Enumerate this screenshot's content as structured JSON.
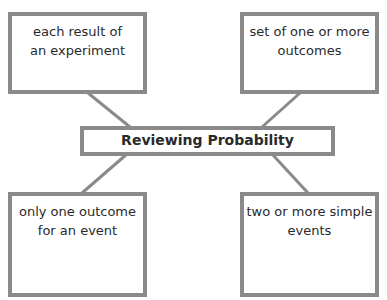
{
  "diagram": {
    "type": "concept-map",
    "center": {
      "label": "Reviewing Probability"
    },
    "nodes": [
      {
        "position": "top-left",
        "lines": [
          "each result of",
          "an experiment"
        ]
      },
      {
        "position": "top-right",
        "lines": [
          "set of one or more",
          "outcomes"
        ]
      },
      {
        "position": "bottom-left",
        "lines": [
          "only one outcome",
          "for an event"
        ]
      },
      {
        "position": "bottom-right",
        "lines": [
          "two or more simple",
          "events"
        ]
      }
    ],
    "colors": {
      "border": "#8a8a8a",
      "text": "#2a2a2a",
      "background": "#ffffff"
    }
  }
}
